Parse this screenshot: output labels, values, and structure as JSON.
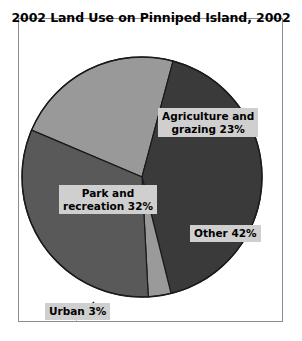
{
  "chart_data": {
    "type": "pie",
    "title": "2002 Land Use on Pinniped Island, 2002",
    "xlabel": "",
    "ylabel": "",
    "legend": "none",
    "grid": false,
    "unit": "percent",
    "total": 100,
    "categories": [
      "Agriculture and grazing",
      "Other",
      "Urban",
      "Park and recreation"
    ],
    "values": [
      23,
      42,
      3,
      32
    ],
    "labels": [
      "Agriculture and grazing 23%",
      "Other 42%",
      "Urban 3%",
      "Park and recreation 32%"
    ],
    "colors": [
      "#999999",
      "#3a3a3a",
      "#9a9a9a",
      "#595959"
    ],
    "slices": [
      {
        "name": "Agriculture and grazing",
        "value": 23,
        "label_line_1": "Agriculture and",
        "label_line_2": "grazing 23%",
        "color": "#999999",
        "start_angle": -67,
        "end_angle": 15,
        "leader_line": false
      },
      {
        "name": "Other",
        "value": 42,
        "label_line_1": "Other 42%",
        "label_line_2": "",
        "color": "#3a3a3a",
        "start_angle": 15,
        "end_angle": 166,
        "leader_line": false
      },
      {
        "name": "Urban",
        "value": 3,
        "label_line_1": "Urban 3%",
        "label_line_2": "",
        "color": "#9a9a9a",
        "start_angle": 166,
        "end_angle": 177,
        "leader_line": true
      },
      {
        "name": "Park and recreation",
        "value": 32,
        "label_line_1": "Park and",
        "label_line_2": "recreation 32%",
        "color": "#595959",
        "start_angle": 177,
        "end_angle": 293,
        "leader_line": false
      }
    ],
    "geometry": {
      "center_x": 124,
      "center_y": 159,
      "radius": 120,
      "outline_color": "#1a1a1a",
      "label_background": "#cfcfcf",
      "frame_color": "#8c8c8c",
      "background": "#ffffff"
    }
  }
}
